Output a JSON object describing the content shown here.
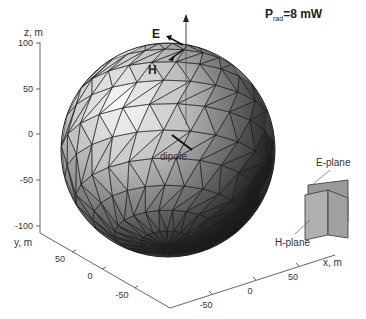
{
  "figure": {
    "title_main": "P",
    "title_sub": "rad",
    "title_value": "=8 mW"
  },
  "axes": {
    "z": {
      "label": "z, m",
      "ticks": [
        "100",
        "50",
        "0",
        "-50",
        "-100"
      ],
      "range": [
        -100,
        100
      ]
    },
    "y": {
      "label": "y, m",
      "ticks": [
        "50",
        "0",
        "-50"
      ],
      "range": [
        -100,
        100
      ]
    },
    "x": {
      "label": "x, m",
      "ticks": [
        "-50",
        "0",
        "50"
      ],
      "range": [
        -100,
        100
      ]
    }
  },
  "annotations": {
    "e_vector": "E",
    "h_vector": "H",
    "dipole": "dipole",
    "e_plane": "E-plane",
    "h_plane": "H-plane"
  },
  "colors": {
    "mesh_edge": "#222222",
    "light_face": "#f2f2f2",
    "dark_face": "#111111",
    "plane_fill": "#a8a8a8",
    "axis": "#555555"
  }
}
